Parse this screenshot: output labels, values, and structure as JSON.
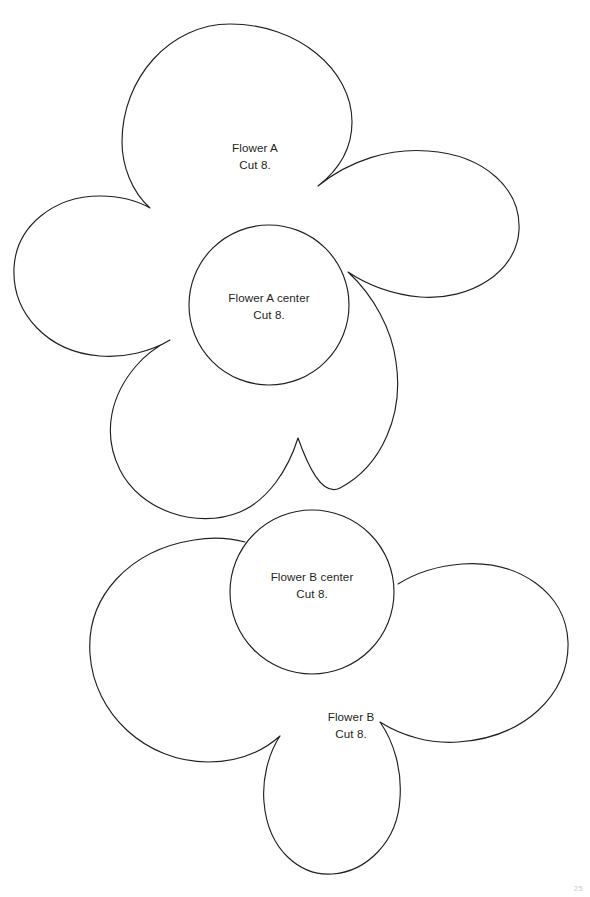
{
  "page": {
    "background_color": "#ffffff",
    "ink_color": "#231f20",
    "width": 590,
    "height": 897,
    "page_number": "25"
  },
  "shapes": [
    {
      "id": "flower-a",
      "name": "Flower A",
      "kind": "five-petal-flower-outline",
      "label_line1": "Flower A",
      "label_line2": "Cut 8.",
      "bounds": {
        "x": 12,
        "y": 24,
        "width": 508,
        "height": 514
      }
    },
    {
      "id": "flower-a-center",
      "name": "Flower A center",
      "kind": "circle",
      "label_line1": "Flower A center",
      "label_line2": "Cut 8.",
      "center": {
        "cx": 269,
        "cy": 305
      },
      "radius": 80
    },
    {
      "id": "flower-b-center",
      "name": "Flower B center",
      "kind": "circle",
      "label_line1": "Flower B center",
      "label_line2": "Cut 8.",
      "center": {
        "cx": 312,
        "cy": 592
      },
      "radius": 82
    },
    {
      "id": "flower-b",
      "name": "Flower B",
      "kind": "four-petal-flower-outline",
      "label_line1": "Flower B",
      "label_line2": "Cut 8.",
      "bounds": {
        "x": 62,
        "y": 498,
        "width": 506,
        "height": 375
      }
    }
  ]
}
